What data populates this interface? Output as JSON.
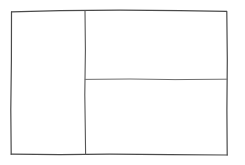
{
  "canvas": {
    "width": 245,
    "height": 165,
    "background_color": "#ffffff",
    "description": "Hand-drawn wireframe layout sketch"
  },
  "style": {
    "stroke_color": "#4a4a4a",
    "stroke_color_light": "#6e6e6e",
    "stroke_width": 1.2,
    "stroke_width_thin": 1.0
  },
  "frame": {
    "name": "outer-frame",
    "top_left": [
      11,
      11
    ],
    "top_right": [
      227,
      11
    ],
    "bottom_right": [
      227,
      155
    ],
    "bottom_left": [
      11,
      154
    ],
    "edges": {
      "top": "M 11.5 11.8 L 60 10.6 L 120 10.2 L 180 10.6 L 226.5 11.4",
      "right": "M 226.8 11.4 L 227.3 60 L 226.9 110 L 227.2 155.0",
      "bottom": "M 227.2 155.0 L 170 154.6 L 110 154.2 L 60 154.6 L 11.2 154.2",
      "left": "M 11.2 154.2 L 10.8 110 L 11.4 60 L 11.5 11.8"
    }
  },
  "dividers": [
    {
      "name": "vertical-divider",
      "orientation": "vertical",
      "path": "M 85.0 10.6 L 85.4 50 L 84.8 95 L 85.3 130 L 85.6 154.4",
      "from": [
        85,
        11
      ],
      "to": [
        85,
        154
      ]
    },
    {
      "name": "horizontal-divider",
      "orientation": "horizontal",
      "path": "M 85.2 79.4 L 130 79.0 L 175 79.6 L 227.1 79.2",
      "from": [
        85,
        79
      ],
      "to": [
        227,
        79
      ]
    }
  ],
  "regions": [
    {
      "name": "left-column-pane",
      "label": "left column",
      "x": 11,
      "y": 11,
      "width": 74,
      "height": 143
    },
    {
      "name": "right-top-pane",
      "label": "right upper",
      "x": 85,
      "y": 11,
      "width": 142,
      "height": 68
    },
    {
      "name": "right-bottom-pane",
      "label": "right lower",
      "x": 85,
      "y": 79,
      "width": 142,
      "height": 76
    }
  ]
}
